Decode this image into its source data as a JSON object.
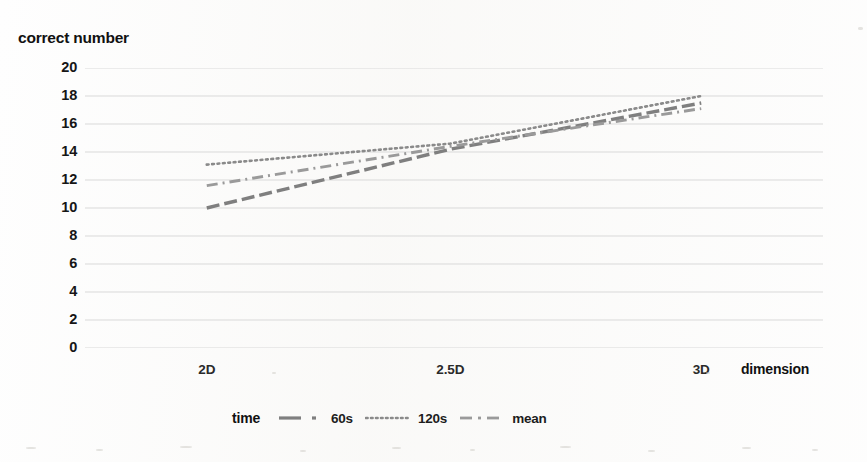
{
  "chart_data": {
    "type": "line",
    "title": "",
    "xlabel": "dimension",
    "ylabel": "correct number",
    "categories": [
      "2D",
      "2.5D",
      "3D"
    ],
    "ylim": [
      0,
      20
    ],
    "ytick_step": 2,
    "yticks": [
      "20",
      "18",
      "16",
      "14",
      "12",
      "10",
      "8",
      "6",
      "4",
      "2",
      "0"
    ],
    "grid": "horizontal",
    "legend_position": "bottom",
    "legend_title": "time",
    "series": [
      {
        "name": "60s",
        "values": [
          10.0,
          14.2,
          17.5
        ],
        "style": "dashed",
        "color": "#7f7f7f"
      },
      {
        "name": "120s",
        "values": [
          13.1,
          14.6,
          18.0
        ],
        "style": "dotted",
        "color": "#8a8a8a"
      },
      {
        "name": "mean",
        "values": [
          11.6,
          14.4,
          17.1
        ],
        "style": "dash-dot",
        "color": "#9a9a9a"
      }
    ]
  },
  "axis": {
    "y_title": "correct number",
    "x_title": "dimension"
  },
  "legend": {
    "title": "time",
    "entries": [
      {
        "label": "60s"
      },
      {
        "label": "120s"
      },
      {
        "label": "mean"
      }
    ]
  },
  "colors": {
    "gridline": "#d9d9d9",
    "series_60s": "#7f7f7f",
    "series_120s": "#8a8a8a",
    "series_mean": "#9a9a9a",
    "text": "#111111",
    "background": "#ffffff"
  }
}
